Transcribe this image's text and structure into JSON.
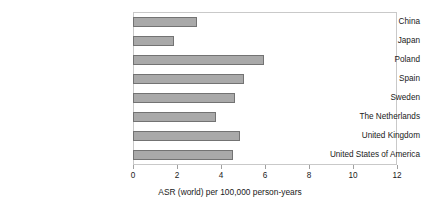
{
  "chart_data": {
    "type": "bar",
    "orientation": "horizontal",
    "title": "",
    "xlabel": "ASR (world) per 100,000 person-years",
    "ylabel": "",
    "xlim": [
      0,
      12
    ],
    "xticks": [
      "0",
      "2",
      "4",
      "6",
      "8",
      "10",
      "12"
    ],
    "grid": false,
    "legend": false,
    "categories": [
      "China",
      "Japan",
      "Poland",
      "Spain",
      "Sweden",
      "The Netherlands",
      "United Kingdom",
      "United States of America"
    ],
    "values": [
      2.9,
      1.85,
      5.95,
      5.05,
      4.65,
      3.75,
      4.85,
      4.55
    ],
    "bar_color": "#a9a9a9",
    "bar_border_color": "#737373",
    "frame_color": "#c9c9c9"
  }
}
